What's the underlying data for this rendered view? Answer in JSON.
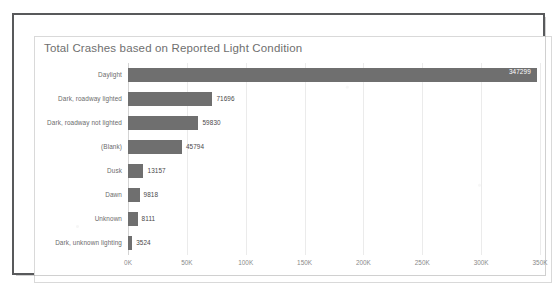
{
  "card": {
    "title": "Total Crashes based on Reported Light Condition"
  },
  "chart_data": {
    "type": "bar",
    "orientation": "horizontal",
    "title": "Total Crashes based on Reported Light Condition",
    "xlabel": "",
    "ylabel": "",
    "categories": [
      "Daylight",
      "Dark, roadway lighted",
      "Dark, roadway not lighted",
      "(Blank)",
      "Dusk",
      "Dawn",
      "Unknown",
      "Dark, unknown lighting"
    ],
    "values": [
      347299,
      71696,
      59830,
      45794,
      13157,
      9818,
      8111,
      3524
    ],
    "value_labels": [
      "347299",
      "71696",
      "59830",
      "45794",
      "13157",
      "9818",
      "8111",
      "3524"
    ],
    "xlim": [
      0,
      350000
    ],
    "xticks": [
      0,
      50000,
      100000,
      150000,
      200000,
      250000,
      300000,
      350000
    ],
    "xtick_labels": [
      "0K",
      "50K",
      "100K",
      "150K",
      "200K",
      "250K",
      "300K",
      "350K"
    ],
    "grid": true,
    "legend": false,
    "bar_color": "#6f6f6f",
    "gridline_color": "#ebebeb",
    "axis_color": "#d4d4d4",
    "label_color": "#6b6b6b",
    "inside_label_color": "#ffffff"
  }
}
